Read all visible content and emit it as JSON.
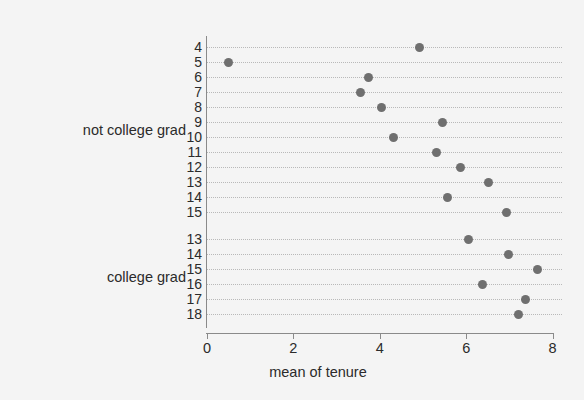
{
  "chart_data": {
    "type": "scatter",
    "title": "",
    "xlabel": "mean of tenure",
    "ylabel": "",
    "xlim": [
      0,
      8.2
    ],
    "xticks": [
      0,
      2,
      4,
      6,
      8
    ],
    "xtick_labels": [
      "0",
      "2",
      "4",
      "6",
      "8"
    ],
    "grid": true,
    "grid_style": "dotted horizontal",
    "legend": "none",
    "orientation": "horizontal dot plot",
    "marker_color": "#6f6f6f",
    "background_color": "#f4f4f4",
    "axis_color": "#8a8a8a",
    "groups": [
      {
        "label": "not college grad",
        "categories": [
          "4",
          "5",
          "6",
          "7",
          "8",
          "9",
          "10",
          "11",
          "12",
          "13",
          "14",
          "15"
        ],
        "values": [
          4.93,
          0.49,
          3.73,
          3.56,
          4.05,
          5.46,
          4.31,
          5.32,
          5.86,
          6.51,
          5.56,
          6.94
        ]
      },
      {
        "label": "college grad",
        "categories": [
          "13",
          "14",
          "15",
          "16",
          "17",
          "18"
        ],
        "values": [
          6.06,
          6.99,
          7.66,
          6.38,
          7.38,
          7.22
        ]
      }
    ]
  }
}
